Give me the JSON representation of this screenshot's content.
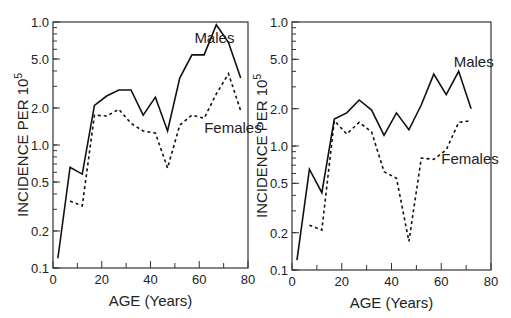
{
  "chart_data": [
    {
      "type": "line",
      "title": "",
      "xlabel": "AGE (Years)",
      "ylabel": "INCIDENCE PER 10^5",
      "ylabel_main": "INCIDENCE PER 10",
      "ylabel_sup": "5",
      "xlim": [
        0,
        80
      ],
      "ylim": [
        0.1,
        10
      ],
      "yscale": "log",
      "xticks": [
        0,
        20,
        40,
        60,
        80
      ],
      "yticks": [
        {
          "value": 10,
          "label": "1.0"
        },
        {
          "value": 5,
          "label": "5.0"
        },
        {
          "value": 2,
          "label": "2.0"
        },
        {
          "value": 1,
          "label": "1.0"
        },
        {
          "value": 0.5,
          "label": "0.5"
        },
        {
          "value": 0.2,
          "label": "0.2"
        },
        {
          "value": 0.1,
          "label": "0.1"
        }
      ],
      "grid": false,
      "series": [
        {
          "name": "Males",
          "style": "solid",
          "x": [
            2,
            7,
            12,
            17,
            22,
            27,
            32,
            37,
            42,
            47,
            52,
            57,
            62,
            67,
            72,
            77
          ],
          "y": [
            0.12,
            0.66,
            0.58,
            2.1,
            2.5,
            2.8,
            2.8,
            1.75,
            2.45,
            1.3,
            3.5,
            5.4,
            5.4,
            9.5,
            6.8,
            3.5
          ]
        },
        {
          "name": "Females",
          "style": "dashed",
          "x": [
            7,
            12,
            17,
            22,
            27,
            32,
            37,
            42,
            47,
            52,
            57,
            62,
            67,
            72,
            77
          ],
          "y": [
            0.35,
            0.32,
            1.75,
            1.72,
            1.95,
            1.5,
            1.3,
            1.25,
            0.65,
            1.45,
            1.75,
            1.65,
            2.6,
            3.8,
            1.9
          ]
        }
      ],
      "annotations": [
        {
          "text": "Males",
          "x": 58,
          "y": 6.8
        },
        {
          "text": "Females",
          "x": 62,
          "y": 1.25
        }
      ]
    },
    {
      "type": "line",
      "title": "",
      "xlabel": "AGE (Years)",
      "ylabel": "INCIDENCE PER 10^5",
      "ylabel_main": "INCIDENCE PER 10",
      "ylabel_sup": "5",
      "xlim": [
        0,
        80
      ],
      "ylim": [
        0.1,
        10
      ],
      "yscale": "log",
      "xticks": [
        0,
        20,
        40,
        60,
        80
      ],
      "yticks": [
        {
          "value": 10,
          "label": "1.0"
        },
        {
          "value": 5,
          "label": "5.0"
        },
        {
          "value": 2,
          "label": "2.0"
        },
        {
          "value": 1,
          "label": "1.0"
        },
        {
          "value": 0.5,
          "label": "0.5"
        },
        {
          "value": 0.2,
          "label": "0.2"
        },
        {
          "value": 0.1,
          "label": "0.1"
        }
      ],
      "grid": false,
      "series": [
        {
          "name": "Males",
          "style": "solid",
          "x": [
            2,
            7,
            12,
            17,
            22,
            27,
            32,
            37,
            42,
            47,
            52,
            57,
            62,
            67,
            72
          ],
          "y": [
            0.12,
            0.65,
            0.42,
            1.65,
            1.85,
            2.35,
            1.95,
            1.22,
            1.85,
            1.35,
            2.15,
            3.8,
            2.6,
            4.0,
            2.0
          ]
        },
        {
          "name": "Females",
          "style": "dashed",
          "x": [
            7,
            12,
            17,
            22,
            27,
            32,
            37,
            42,
            47,
            52,
            57,
            62,
            67,
            72
          ],
          "y": [
            0.23,
            0.21,
            1.6,
            1.25,
            1.55,
            1.3,
            0.62,
            0.55,
            0.17,
            0.8,
            0.78,
            0.93,
            1.55,
            1.6
          ]
        }
      ],
      "annotations": [
        {
          "text": "Males",
          "x": 65,
          "y": 4.3
        },
        {
          "text": "Females",
          "x": 60,
          "y": 0.72
        }
      ]
    }
  ]
}
